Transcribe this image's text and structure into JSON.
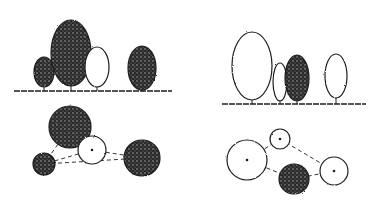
{
  "diagram": {
    "type": "tree-planting-sketch",
    "colors": {
      "ink": "#1e1e1e",
      "paper": "#ffffff",
      "stipple": "#555555"
    },
    "panels": [
      {
        "name": "left",
        "elevation": {
          "ground_y": 91,
          "trees": [
            {
              "shape": "oval",
              "cx": 44,
              "cy": 72,
              "rx": 10,
              "ry": 15,
              "fill": "dark"
            },
            {
              "shape": "oval",
              "cx": 71,
              "cy": 53,
              "rx": 20,
              "ry": 33,
              "fill": "dark"
            },
            {
              "shape": "oval",
              "cx": 97,
              "cy": 67,
              "rx": 12,
              "ry": 20,
              "fill": "light"
            },
            {
              "shape": "oval",
              "cx": 142,
              "cy": 68,
              "rx": 14,
              "ry": 22,
              "fill": "dark"
            }
          ]
        },
        "plan": {
          "circles": [
            {
              "cx": 70,
              "cy": 127,
              "r": 21,
              "fill": "dark"
            },
            {
              "cx": 92,
              "cy": 150,
              "r": 14,
              "fill": "light"
            },
            {
              "cx": 44,
              "cy": 164,
              "r": 11,
              "fill": "dark"
            },
            {
              "cx": 142,
              "cy": 158,
              "r": 18,
              "fill": "dark"
            }
          ],
          "links": [
            [
              0,
              1
            ],
            [
              1,
              2
            ],
            [
              1,
              3
            ],
            [
              0,
              2
            ],
            [
              2,
              3
            ]
          ]
        }
      },
      {
        "name": "right",
        "elevation": {
          "ground_y": 104,
          "trees": [
            {
              "shape": "oval",
              "cx": 252,
              "cy": 66,
              "rx": 20,
              "ry": 34,
              "fill": "light"
            },
            {
              "shape": "oval",
              "cx": 280,
              "cy": 82,
              "rx": 7,
              "ry": 19,
              "fill": "light"
            },
            {
              "shape": "oval",
              "cx": 297,
              "cy": 78,
              "rx": 12,
              "ry": 23,
              "fill": "dark"
            },
            {
              "shape": "oval",
              "cx": 336,
              "cy": 76,
              "rx": 11,
              "ry": 22,
              "fill": "light"
            }
          ]
        },
        "plan": {
          "circles": [
            {
              "cx": 247,
              "cy": 160,
              "r": 20,
              "fill": "light"
            },
            {
              "cx": 280,
              "cy": 139,
              "r": 10,
              "fill": "light"
            },
            {
              "cx": 294,
              "cy": 179,
              "r": 15,
              "fill": "dark"
            },
            {
              "cx": 334,
              "cy": 171,
              "r": 14,
              "fill": "light"
            }
          ],
          "links": [
            [
              0,
              1
            ],
            [
              1,
              3
            ],
            [
              0,
              2
            ],
            [
              2,
              3
            ]
          ]
        }
      }
    ]
  }
}
